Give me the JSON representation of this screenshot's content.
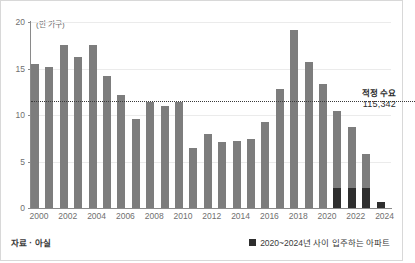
{
  "axis": {
    "unit_label": "(만 가구)",
    "y_ticks": [
      "0",
      "5",
      "10",
      "15",
      "20"
    ],
    "x_ticks": [
      "2000",
      "2002",
      "2004",
      "2006",
      "2008",
      "2010",
      "2012",
      "2014",
      "2016",
      "2018",
      "2020",
      "2022",
      "2024"
    ]
  },
  "annotation": {
    "demand_title": "적정 수요",
    "demand_value": "115,342"
  },
  "footer": {
    "source": "자료 · 아실",
    "legend_label": "2020~2024년 사이 입주하는 아파트"
  },
  "colors": {
    "bar_light": "#7d7d7d",
    "bar_dark": "#2e2e2e",
    "grid": "#ebebeb",
    "axis": "#8a8a8a"
  },
  "chart_data": {
    "type": "bar",
    "title": "",
    "subtitle": "",
    "xlabel": "",
    "ylabel": "(만 가구)",
    "ylim": [
      0,
      20
    ],
    "grid": true,
    "legend_position": "bottom-right",
    "categories": [
      "2000",
      "2001",
      "2002",
      "2003",
      "2004",
      "2005",
      "2006",
      "2007",
      "2008",
      "2009",
      "2010",
      "2011",
      "2012",
      "2013",
      "2014",
      "2015",
      "2016",
      "2017",
      "2018",
      "2019",
      "2020",
      "2021",
      "2022",
      "2023",
      "2024"
    ],
    "series": [
      {
        "name": "총 입주 물량",
        "values": [
          15.5,
          15.2,
          17.5,
          16.2,
          17.5,
          14.2,
          12.1,
          9.6,
          11.4,
          11.0,
          11.4,
          6.5,
          8.0,
          7.1,
          7.2,
          7.4,
          9.3,
          12.8,
          19.1,
          15.7,
          13.3,
          10.4,
          8.7,
          5.8,
          0.6
        ]
      },
      {
        "name": "2020~2024년 사이 입주하는 아파트",
        "values": [
          0,
          0,
          0,
          0,
          0,
          0,
          0,
          0,
          0,
          0,
          0,
          0,
          0,
          0,
          0,
          0,
          0,
          0,
          0,
          0,
          0,
          2.2,
          2.2,
          2.2,
          0.6
        ]
      }
    ],
    "reference_line": {
      "label": "적정 수요",
      "value_label": "115,342",
      "value": 11.5342
    }
  }
}
